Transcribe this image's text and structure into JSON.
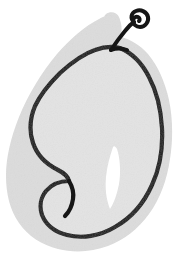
{
  "artwork": {
    "title": "Pear",
    "subject": "pear-fruit",
    "style": "hand-drawn ink line illustration with offset flat shadow",
    "background_color": "#ffffff",
    "canvas": {
      "width": 180,
      "height": 266
    },
    "palette": {
      "background": "#ffffff",
      "shadow_fill": "#dcdcdc",
      "outline": "#161616",
      "body_fill": "#e3e3e3",
      "highlight": "#ffffff"
    },
    "elements": [
      {
        "name": "shadow-blob",
        "label": "Offset gray silhouette behind the pear",
        "color": "#dcdcdc"
      },
      {
        "name": "pear-body",
        "label": "Pear body outline",
        "color": "#161616",
        "stroke_width": 4.2
      },
      {
        "name": "pear-stem",
        "label": "Curled stem at the top of the pear",
        "color": "#161616",
        "stroke_width": 4
      },
      {
        "name": "pear-highlight",
        "label": "White sliver highlight inside the pear body",
        "color": "#ffffff"
      },
      {
        "name": "pear-bottom-notch",
        "label": "Small inward dip where the two lower lobes meet",
        "color": "#161616"
      }
    ]
  }
}
